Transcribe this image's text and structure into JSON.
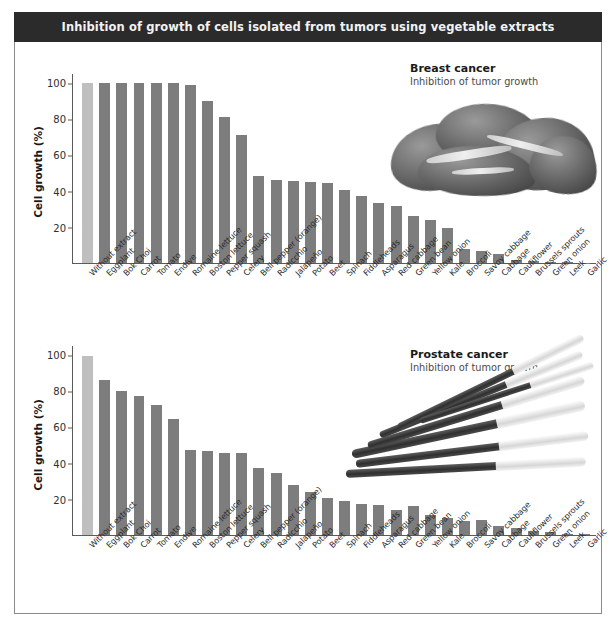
{
  "banner": {
    "title": "Inhibition of growth of cells isolated from tumors using vegetable extracts"
  },
  "colors": {
    "banner_background": "#2b2b2b",
    "banner_text": "#f2f2f2",
    "bar": "#7d7d7d",
    "bar_highlight": "#bfbfbf",
    "axis": "#5a5a5a",
    "page_background": "#ffffff"
  },
  "panels": [
    {
      "annotation_title": "Breast cancer",
      "annotation_subtitle": "Inhibition of tumor growth",
      "produce_image": "kale-photo"
    },
    {
      "annotation_title": "Prostate cancer",
      "annotation_subtitle": "Inhibition of tumor growth",
      "produce_image": "green-onion-photo"
    }
  ],
  "chart_data": [
    {
      "type": "bar",
      "title": "Breast cancer",
      "subtitle": "Inhibition of tumor growth",
      "xlabel": "",
      "ylabel": "Cell growth (%)",
      "ylim": [
        0,
        105
      ],
      "yticks": [
        20,
        40,
        60,
        80,
        100
      ],
      "grid": false,
      "legend": "none",
      "highlight_category": "Without extract",
      "categories": [
        "Without extract",
        "Eggplant",
        "Bok Choi",
        "Carrot",
        "Tomato",
        "Endive",
        "Romaine lettuce",
        "Boston lettuce",
        "Pepper squash",
        "Celery",
        "Bell pepper (orange)",
        "Radicchio",
        "Jalapeño",
        "Potato",
        "Beet",
        "Spinach",
        "Fiddleheads",
        "Asparagus",
        "Red cabbage",
        "Green bean",
        "Yellow onion",
        "Kale",
        "Broccoli",
        "Savoy cabbage",
        "Cabbage",
        "Cauliflower",
        "Brussels sprouts",
        "Green onion",
        "Leek",
        "Garlic"
      ],
      "values": [
        100,
        100,
        100,
        100,
        100,
        100,
        99,
        90,
        81,
        71,
        48.5,
        46,
        45.5,
        45,
        44.5,
        40.5,
        37.5,
        33.5,
        31.5,
        26,
        24,
        19.5,
        8,
        6.5,
        5,
        1.5,
        1,
        0.5,
        0.3,
        0.2
      ]
    },
    {
      "type": "bar",
      "title": "Prostate cancer",
      "subtitle": "Inhibition of tumor growth",
      "xlabel": "",
      "ylabel": "Cell growth (%)",
      "ylim": [
        0,
        105
      ],
      "yticks": [
        20,
        40,
        60,
        80,
        100
      ],
      "grid": false,
      "legend": "none",
      "highlight_category": "Without extract",
      "categories": [
        "Without extract",
        "Eggplant",
        "Bok Choi",
        "Carrot",
        "Tomato",
        "Endive",
        "Romaine lettuce",
        "Boston lettuce",
        "Pepper squash",
        "Celery",
        "Bell pepper (orange)",
        "Radicchio",
        "Jalapeño",
        "Potato",
        "Beet",
        "Spinach",
        "Fiddleheads",
        "Asparagus",
        "Red cabbage",
        "Green bean",
        "Yellow onion",
        "Kale",
        "Broccoli",
        "Savoy cabbage",
        "Cabbage",
        "Cauliflower",
        "Brussels sprouts",
        "Green onion",
        "Leek",
        "Garlic"
      ],
      "values": [
        99.5,
        86,
        80,
        77.5,
        72.5,
        64.5,
        47.5,
        46.5,
        45.5,
        45.5,
        37,
        34.5,
        28,
        24,
        20.5,
        19,
        17,
        16.5,
        14,
        16,
        11,
        9.5,
        8,
        8.5,
        5,
        4,
        2.5,
        1.5,
        0.8,
        0.5
      ]
    }
  ]
}
